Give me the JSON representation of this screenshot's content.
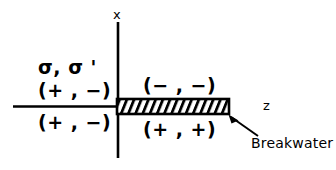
{
  "figure": {
    "type": "schematic-diagram",
    "background_color": "#ffffff",
    "line_color": "#000000"
  },
  "axes": {
    "vertical": {
      "label": "x",
      "name": "x-axis"
    },
    "horizontal": {
      "label": "z",
      "name": "z-axis"
    }
  },
  "legend_symbol": {
    "text": "σ, σ '"
  },
  "regions": [
    {
      "name": "upper-left-region",
      "label": "(+ , −)"
    },
    {
      "name": "lower-left-region",
      "label": "(+ , −)"
    },
    {
      "name": "upper-right-region",
      "label": "(− , −)"
    },
    {
      "name": "lower-right-region",
      "label": "(+ , +)"
    }
  ],
  "breakwater": {
    "label": "Breakwater",
    "fill": "hatched",
    "hatch_direction": "forward-slash",
    "outline_color": "#000000"
  }
}
